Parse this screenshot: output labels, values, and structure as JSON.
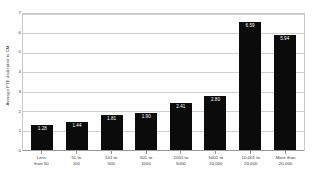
{
  "chart_data": {
    "type": "bar",
    "title": "",
    "xlabel": "",
    "ylabel": "Average FTE dedicated to CM",
    "categories": [
      "Less than 50",
      "51 to 100",
      "101 to 500",
      "501 to 1000",
      "1001 to 5000",
      "5001 to 10,000",
      "10,001 to 20,000",
      "More than 20,000"
    ],
    "category_lines": [
      [
        "Less",
        "than 50"
      ],
      [
        "51 to",
        "100"
      ],
      [
        "101 to",
        "500"
      ],
      [
        "501 to",
        "1000"
      ],
      [
        "1001 to",
        "5000"
      ],
      [
        "5001 to",
        "10,000"
      ],
      [
        "10,001 to",
        "20,000"
      ],
      [
        "More than",
        "20,000"
      ]
    ],
    "values": [
      1.28,
      1.44,
      1.81,
      1.9,
      2.41,
      2.8,
      6.59,
      5.94
    ],
    "value_labels": [
      "1.28",
      "1.44",
      "1.81",
      "1.90",
      "2.41",
      "2.80",
      "6.59",
      "5.94"
    ],
    "ylim": [
      0,
      7
    ],
    "yticks": [
      0,
      1,
      2,
      3,
      4,
      5,
      6,
      7
    ],
    "ytick_labels": [
      "0",
      "1",
      "2",
      "3",
      "4",
      "5",
      "6",
      "7"
    ],
    "grid": true,
    "legend": false,
    "legend_position": "none",
    "bar_color": "#0b0b0b",
    "value_label_color": "#ffffff",
    "grid_color": "#cfcfcf",
    "axis_color": "#9a9a9a",
    "plot_background": "#ffffff"
  }
}
